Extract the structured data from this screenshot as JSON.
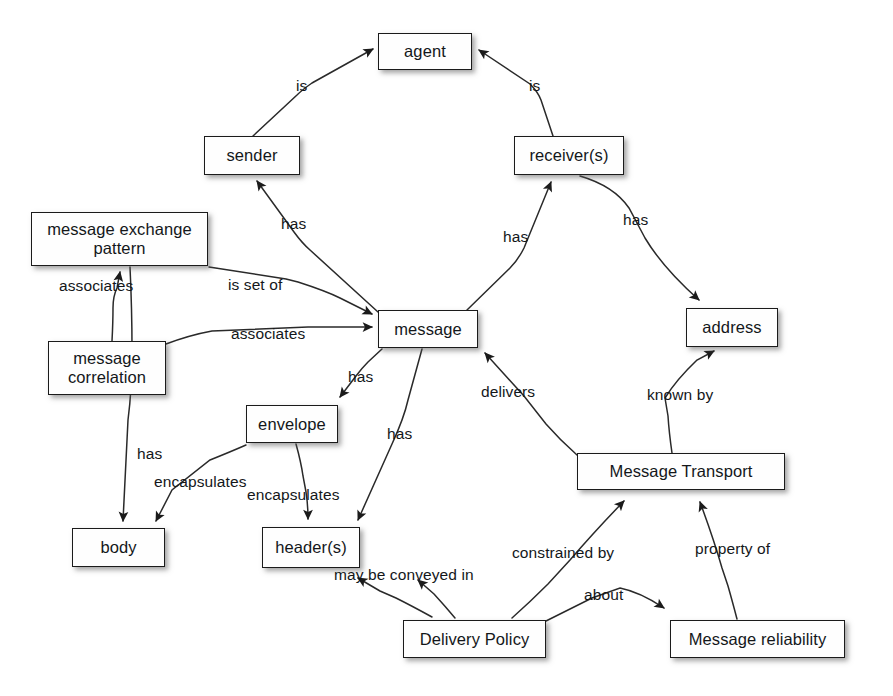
{
  "diagram": {
    "background_color": "#ffffff",
    "node_fill": "#fefefe",
    "node_stroke": "#1b1b1b",
    "text_color": "#14171a",
    "nodes": [
      {
        "id": "agent",
        "label": "agent",
        "x": 378,
        "y": 33,
        "w": 94,
        "h": 37
      },
      {
        "id": "sender",
        "label": "sender",
        "x": 204,
        "y": 136,
        "w": 96,
        "h": 39
      },
      {
        "id": "receivers",
        "label": "receiver(s)",
        "x": 514,
        "y": 136,
        "w": 110,
        "h": 39
      },
      {
        "id": "mep",
        "label": "message exchange\npattern",
        "x": 31,
        "y": 212,
        "w": 177,
        "h": 54
      },
      {
        "id": "message_correlation",
        "label": "message\ncorrelation",
        "x": 48,
        "y": 341,
        "w": 118,
        "h": 54
      },
      {
        "id": "message",
        "label": "message",
        "x": 378,
        "y": 310,
        "w": 100,
        "h": 38
      },
      {
        "id": "address",
        "label": "address",
        "x": 686,
        "y": 308,
        "w": 92,
        "h": 39
      },
      {
        "id": "envelope",
        "label": "envelope",
        "x": 246,
        "y": 405,
        "w": 92,
        "h": 38
      },
      {
        "id": "message_transport",
        "label": "Message Transport",
        "x": 577,
        "y": 453,
        "w": 208,
        "h": 37
      },
      {
        "id": "body",
        "label": "body",
        "x": 72,
        "y": 528,
        "w": 93,
        "h": 39
      },
      {
        "id": "headers",
        "label": "header(s)",
        "x": 262,
        "y": 527,
        "w": 98,
        "h": 41
      },
      {
        "id": "delivery_policy",
        "label": "Delivery Policy",
        "x": 403,
        "y": 620,
        "w": 143,
        "h": 38
      },
      {
        "id": "message_reliability",
        "label": "Message reliability",
        "x": 670,
        "y": 620,
        "w": 175,
        "h": 38
      }
    ],
    "edges": [
      {
        "id": "sender_is_agent",
        "label": "is",
        "from": "sender",
        "to": "agent",
        "label_x": 296,
        "label_y": 77
      },
      {
        "id": "receivers_is_agent",
        "label": "is",
        "from": "receivers",
        "to": "agent",
        "label_x": 529,
        "label_y": 77
      },
      {
        "id": "message_has_sender",
        "label": "has",
        "from": "message",
        "to": "sender",
        "label_x": 281,
        "label_y": 215
      },
      {
        "id": "message_has_receivers",
        "label": "has",
        "from": "message",
        "to": "receivers",
        "label_x": 503,
        "label_y": 228
      },
      {
        "id": "receivers_has_address",
        "label": "has",
        "from": "receivers",
        "to": "address",
        "label_x": 623,
        "label_y": 211
      },
      {
        "id": "mep_is_set_of_message",
        "label": "is set of",
        "from": "mep",
        "to": "message",
        "label_x": 228,
        "label_y": 276
      },
      {
        "id": "correlation_associates_mep",
        "label": "associates",
        "from": "message_correlation",
        "to": "mep",
        "label_x": 59,
        "label_y": 277
      },
      {
        "id": "correlation_assoc_message",
        "label": "associates",
        "from": "message_correlation",
        "to": "message",
        "label_x": 231,
        "label_y": 325
      },
      {
        "id": "message_has_envelope",
        "label": "has",
        "from": "message",
        "to": "envelope",
        "label_x": 348,
        "label_y": 368
      },
      {
        "id": "message_has_headers",
        "label": "has",
        "from": "message",
        "to": "headers",
        "label_x": 387,
        "label_y": 425
      },
      {
        "id": "mep_has_body",
        "label": "has",
        "from": "mep",
        "to": "body",
        "label_x": 137,
        "label_y": 445
      },
      {
        "id": "envelope_encapsulates_body",
        "label": "encapsulates",
        "from": "envelope",
        "to": "body",
        "label_x": 154,
        "label_y": 473
      },
      {
        "id": "envelope_encaps_headers",
        "label": "encapsulates",
        "from": "envelope",
        "to": "headers",
        "label_x": 247,
        "label_y": 486
      },
      {
        "id": "transport_delivers_message",
        "label": "delivers",
        "from": "message_transport",
        "to": "message",
        "label_x": 481,
        "label_y": 383
      },
      {
        "id": "transport_known_by_address",
        "label": "known by",
        "from": "message_transport",
        "to": "address",
        "label_x": 647,
        "label_y": 386
      },
      {
        "id": "policy_constrains_transport",
        "label": "constrained by",
        "from": "delivery_policy",
        "to": "message_transport",
        "label_x": 512,
        "label_y": 544
      },
      {
        "id": "reliability_property_of",
        "label": "property of",
        "from": "message_reliability",
        "to": "message_transport",
        "label_x": 695,
        "label_y": 540
      },
      {
        "id": "policy_conveyed_in_headers",
        "label": "may be conveyed in",
        "from": "delivery_policy",
        "to": "headers",
        "label_x": 334,
        "label_y": 566
      },
      {
        "id": "policy_about_reliability",
        "label": "about",
        "from": "delivery_policy",
        "to": "message_reliability",
        "label_x": 584,
        "label_y": 586
      }
    ],
    "caption": ""
  }
}
